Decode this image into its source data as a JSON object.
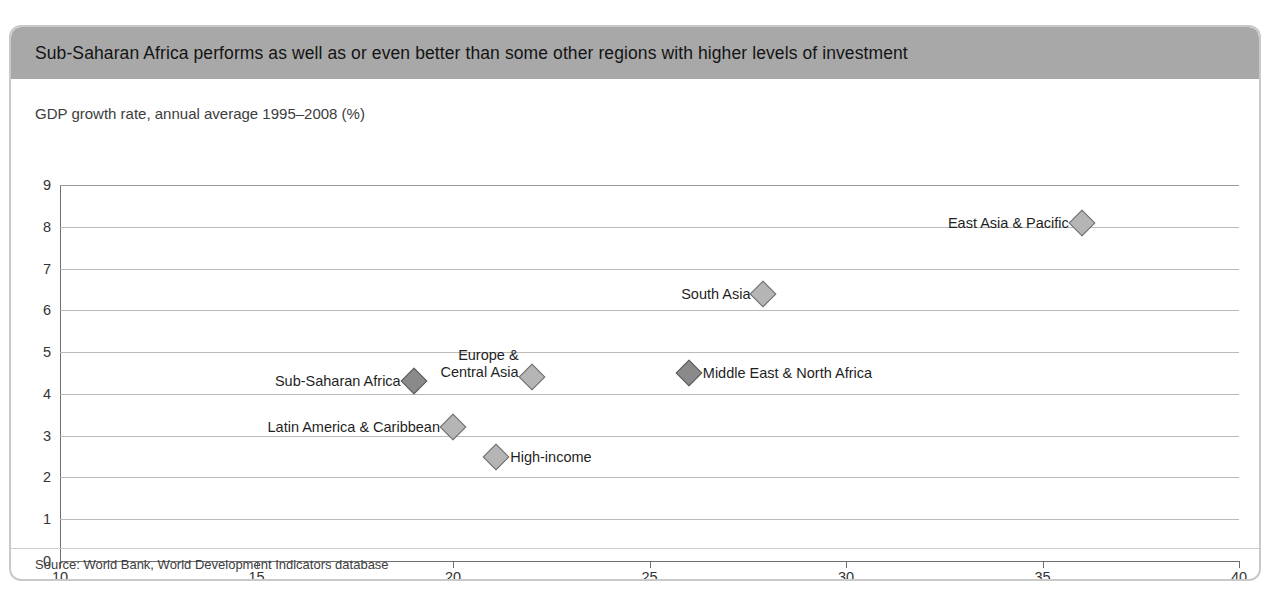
{
  "figure": {
    "title": "Sub-Saharan Africa performs as well as or even better than some other regions with higher levels of investment",
    "source": "Source:  World Bank, World Development Indicators database",
    "band_color": "#a8a8a8",
    "border_color": "#c9c9c9"
  },
  "chart_data": {
    "type": "scatter",
    "title": "Sub-Saharan Africa performs as well as or even better than some other regions with higher levels of investment",
    "xlabel": "Gross capital formation, average 1995–2008 (% of GDP)",
    "ylabel": "GDP growth rate, annual average 1995–2008 (%)",
    "xlim": [
      10,
      40
    ],
    "ylim": [
      0,
      9
    ],
    "xticks": [
      10,
      15,
      20,
      25,
      30,
      35,
      40
    ],
    "yticks": [
      0,
      1,
      2,
      3,
      4,
      5,
      6,
      7,
      8,
      9
    ],
    "grid": "horizontal",
    "legend": "none",
    "marker": "diamond",
    "points": [
      {
        "label": "East Asia & Pacific",
        "x": 36.0,
        "y": 8.1,
        "label_pos": "left",
        "shade": "light"
      },
      {
        "label": "South Asia",
        "x": 27.9,
        "y": 6.4,
        "label_pos": "left",
        "shade": "light"
      },
      {
        "label": "Europe &\nCentral Asia",
        "x": 22.0,
        "y": 4.4,
        "label_pos": "left",
        "shade": "light"
      },
      {
        "label": "Middle East & North Africa",
        "x": 26.0,
        "y": 4.5,
        "label_pos": "right",
        "shade": "dark"
      },
      {
        "label": "Sub-Saharan Africa",
        "x": 19.0,
        "y": 4.3,
        "label_pos": "left",
        "shade": "dark"
      },
      {
        "label": "Latin America & Caribbean",
        "x": 20.0,
        "y": 3.2,
        "label_pos": "left",
        "shade": "light"
      },
      {
        "label": "High-income",
        "x": 21.1,
        "y": 2.5,
        "label_pos": "right",
        "shade": "light"
      }
    ]
  },
  "labels": {
    "europe_line1": "Europe &",
    "europe_line2": "Central Asia"
  }
}
